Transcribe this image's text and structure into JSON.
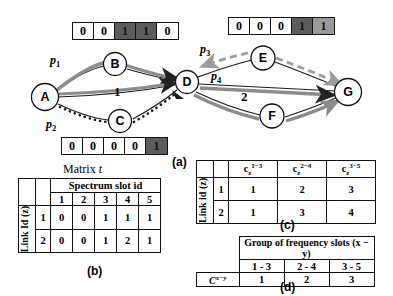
{
  "figure": {
    "panel_a_label": "(a)",
    "panel_b_label": "(b)",
    "panel_c_label": "(c)",
    "panel_d_label": "(d)"
  },
  "graph": {
    "nodes": [
      {
        "id": "A",
        "label": "A",
        "x": 45,
        "y": 97
      },
      {
        "id": "B",
        "label": "B",
        "x": 115,
        "y": 64
      },
      {
        "id": "C",
        "label": "C",
        "x": 120,
        "y": 121
      },
      {
        "id": "D",
        "label": "D",
        "x": 187,
        "y": 82
      },
      {
        "id": "E",
        "label": "E",
        "x": 263,
        "y": 58
      },
      {
        "id": "F",
        "label": "F",
        "x": 272,
        "y": 116
      },
      {
        "id": "G",
        "label": "G",
        "x": 348,
        "y": 92
      }
    ],
    "path_labels": [
      {
        "name": "p1",
        "base": "p",
        "sub": "1",
        "x": 50,
        "y": 58
      },
      {
        "name": "p2",
        "base": "p",
        "sub": "2",
        "x": 48,
        "y": 121
      },
      {
        "name": "p3",
        "base": "p",
        "sub": "3",
        "x": 202,
        "y": 47
      },
      {
        "name": "p4",
        "base": "p",
        "sub": "4",
        "x": 212,
        "y": 74
      },
      {
        "name": "p5",
        "base": "p",
        "sub": "5",
        "x": 0,
        "y": 0
      }
    ],
    "edge_labels": [
      {
        "text": "1",
        "x": 117,
        "y": 91
      },
      {
        "text": "2",
        "x": 243,
        "y": 96
      }
    ]
  },
  "bitmaps": {
    "top_left": {
      "bits": [
        "0",
        "0",
        "1",
        "1",
        "0"
      ],
      "shades": [
        "none",
        "none",
        "dark",
        "dark",
        "none"
      ],
      "x": 72,
      "y": 22
    },
    "top_right": {
      "bits": [
        "0",
        "0",
        "0",
        "1",
        "1"
      ],
      "shades": [
        "none",
        "none",
        "none",
        "dark",
        "mid"
      ],
      "x": 228,
      "y": 17
    },
    "bottom": {
      "bits": [
        "0",
        "0",
        "0",
        "0",
        "1"
      ],
      "shades": [
        "none",
        "none",
        "none",
        "none",
        "dark"
      ],
      "x": 61,
      "y": 137
    }
  },
  "matrix_t": {
    "title_prefix": "Matrix ",
    "title_italic": "t",
    "col_group_header": "Spectrum slot id",
    "row_group_header": "Link Id (z)",
    "slot_headers": [
      "1",
      "2",
      "3",
      "4",
      "5"
    ],
    "rows": [
      {
        "link_id": "1",
        "values": [
          "0",
          "0",
          "1",
          "1",
          "1"
        ]
      },
      {
        "link_id": "2",
        "values": [
          "0",
          "0",
          "1",
          "2",
          "1"
        ]
      }
    ]
  },
  "table_c": {
    "row_group_header": "Link id (z)",
    "col_headers": [
      {
        "base": "c",
        "sub": "z",
        "sup": "1−3"
      },
      {
        "base": "c",
        "sub": "z",
        "sup": "2−4"
      },
      {
        "base": "c",
        "sub": "z",
        "sup": "3−5"
      }
    ],
    "rows": [
      {
        "link_id": "1",
        "values": [
          "1",
          "2",
          "3"
        ]
      },
      {
        "link_id": "2",
        "values": [
          "1",
          "3",
          "4"
        ]
      }
    ]
  },
  "table_d": {
    "group_header": "Group of frequency slots (x − y)",
    "range_headers": [
      "1 - 3",
      "2 - 4",
      "3 - 5"
    ],
    "row_label": {
      "base": "C",
      "sup": "x−y"
    },
    "values": [
      "1",
      "2",
      "3"
    ]
  },
  "colors": {
    "dark_cell": "#5c5c5c",
    "mid_cell": "#9a9a9a",
    "grey_path": "#8c8c8c",
    "line": "#111111"
  }
}
